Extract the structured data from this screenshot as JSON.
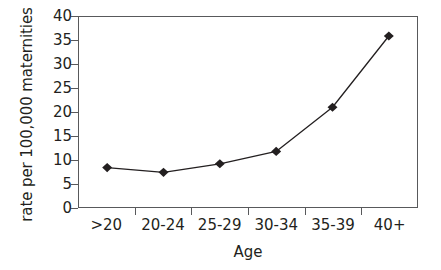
{
  "chart_data": {
    "type": "line",
    "title": "",
    "xlabel": "Age",
    "ylabel": "rate per 100,000 maternities",
    "categories": [
      ">20",
      "20-24",
      "25-29",
      "30-34",
      "35-39",
      "40+"
    ],
    "values": [
      8.3,
      7.3,
      9.1,
      11.7,
      21.0,
      36.0
    ],
    "series": [
      {
        "name": "rate",
        "values": [
          8.3,
          7.3,
          9.1,
          11.7,
          21.0,
          36.0
        ]
      }
    ],
    "ylim": [
      0,
      40
    ],
    "yticks": [
      0,
      5,
      10,
      15,
      20,
      25,
      30,
      35,
      40
    ],
    "ytick_labels": [
      "0",
      "5",
      "10",
      "15",
      "20",
      "25",
      "30",
      "35",
      "40"
    ],
    "grid": false,
    "legend": false,
    "legend_position": "none",
    "marker": "diamond",
    "marker_color": "#231f20",
    "line_color": "#231f20",
    "frame_color": "#58595b",
    "background_color": "#ffffff"
  }
}
